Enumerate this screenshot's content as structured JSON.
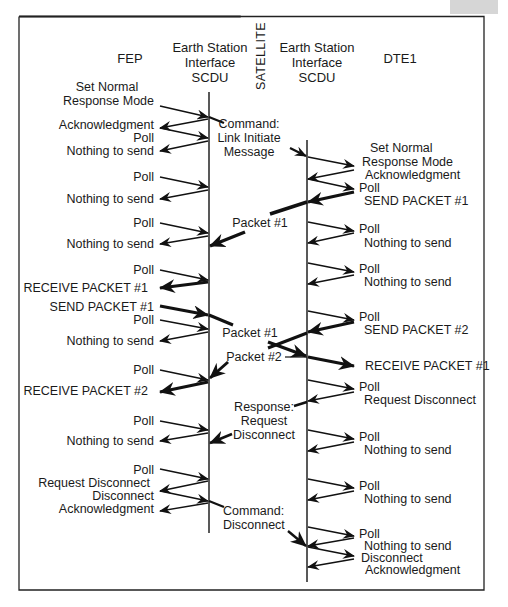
{
  "diagram": {
    "type": "sequence-diagram",
    "headers": {
      "fep": "FEP",
      "earth_station_left": [
        "Earth Station",
        "Interface",
        "SCDU"
      ],
      "satellite": "SATELLITE",
      "earth_station_right": [
        "Earth Station",
        "Interface",
        "SCDU"
      ],
      "dte1": "DTE1"
    },
    "left_messages": [
      {
        "text": [
          "Set Normal",
          "Response Mode"
        ],
        "dir": "to-scdu"
      },
      {
        "text": [
          "Acknowledgment"
        ],
        "dir": "to-fep"
      },
      {
        "text": [
          "Poll"
        ],
        "dir": "to-scdu"
      },
      {
        "text": [
          "Nothing to send"
        ],
        "dir": "to-fep"
      },
      {
        "text": [
          "Poll"
        ],
        "dir": "to-scdu"
      },
      {
        "text": [
          "Nothing to send"
        ],
        "dir": "to-fep"
      },
      {
        "text": [
          "Poll"
        ],
        "dir": "to-scdu"
      },
      {
        "text": [
          "Nothing to send"
        ],
        "dir": "to-fep"
      },
      {
        "text": [
          "Poll"
        ],
        "dir": "to-scdu"
      },
      {
        "text": [
          "RECEIVE PACKET #1"
        ],
        "dir": "to-fep",
        "bold": true
      },
      {
        "text": [
          "SEND PACKET #1"
        ],
        "dir": "to-scdu",
        "bold": true
      },
      {
        "text": [
          "Poll"
        ],
        "dir": "to-scdu"
      },
      {
        "text": [
          "Nothing to send"
        ],
        "dir": "to-fep"
      },
      {
        "text": [
          "Poll"
        ],
        "dir": "to-scdu"
      },
      {
        "text": [
          "RECEIVE PACKET #2"
        ],
        "dir": "to-fep",
        "bold": true
      },
      {
        "text": [
          "Poll"
        ],
        "dir": "to-scdu"
      },
      {
        "text": [
          "Nothing to send"
        ],
        "dir": "to-fep"
      },
      {
        "text": [
          "Poll"
        ],
        "dir": "to-scdu"
      },
      {
        "text": [
          "Request Disconnect"
        ],
        "dir": "to-fep"
      },
      {
        "text": [
          "Disconnect"
        ],
        "dir": "to-scdu"
      },
      {
        "text": [
          "Acknowledgment"
        ],
        "dir": "to-fep"
      }
    ],
    "satellite_messages": [
      {
        "text": [
          "Command:",
          "Link Initiate",
          "Message"
        ],
        "dir": "left-to-right"
      },
      {
        "text": [
          "Packet #1"
        ],
        "dir": "right-to-left",
        "bold": true
      },
      {
        "text": [
          "Packet #1"
        ],
        "dir": "left-to-right",
        "bold": true
      },
      {
        "text": [
          "Packet #2"
        ],
        "dir": "right-to-left",
        "bold": true
      },
      {
        "text": [
          "Response:",
          "Request",
          "Disconnect"
        ],
        "dir": "right-to-left"
      },
      {
        "text": [
          "Command:",
          "Disconnect"
        ],
        "dir": "left-to-right"
      }
    ],
    "right_messages": [
      {
        "text": [
          "Set Normal",
          "Response Mode"
        ],
        "dir": "to-dte"
      },
      {
        "text": [
          "Acknowledgment"
        ],
        "dir": "to-scdu"
      },
      {
        "text": [
          "Poll"
        ],
        "dir": "to-dte"
      },
      {
        "text": [
          "SEND PACKET #1"
        ],
        "dir": "to-scdu",
        "bold": true
      },
      {
        "text": [
          "Poll"
        ],
        "dir": "to-dte"
      },
      {
        "text": [
          "Nothing to send"
        ],
        "dir": "to-scdu"
      },
      {
        "text": [
          "Poll"
        ],
        "dir": "to-dte"
      },
      {
        "text": [
          "Nothing to send"
        ],
        "dir": "to-scdu"
      },
      {
        "text": [
          "Poll"
        ],
        "dir": "to-dte"
      },
      {
        "text": [
          "SEND PACKET #2"
        ],
        "dir": "to-scdu",
        "bold": true
      },
      {
        "text": [
          "RECEIVE PACKET #1"
        ],
        "dir": "to-dte",
        "bold": true
      },
      {
        "text": [
          "Poll"
        ],
        "dir": "to-dte"
      },
      {
        "text": [
          "Request Disconnect"
        ],
        "dir": "to-scdu"
      },
      {
        "text": [
          "Poll"
        ],
        "dir": "to-dte"
      },
      {
        "text": [
          "Nothing to send"
        ],
        "dir": "to-scdu"
      },
      {
        "text": [
          "Poll"
        ],
        "dir": "to-dte"
      },
      {
        "text": [
          "Nothing to send"
        ],
        "dir": "to-scdu"
      },
      {
        "text": [
          "Poll"
        ],
        "dir": "to-dte"
      },
      {
        "text": [
          "Nothing to send"
        ],
        "dir": "to-scdu"
      },
      {
        "text": [
          "Disconnect"
        ],
        "dir": "to-dte"
      },
      {
        "text": [
          "Acknowledgment"
        ],
        "dir": "to-scdu"
      }
    ]
  }
}
